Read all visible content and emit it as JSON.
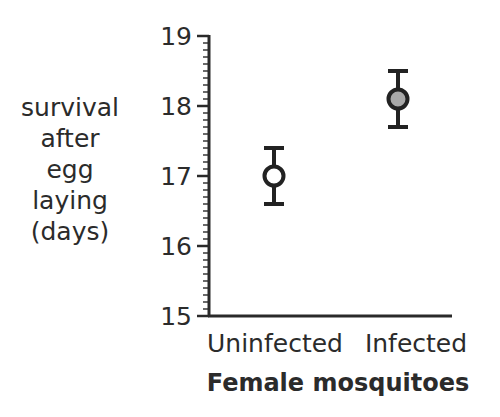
{
  "chart_data": {
    "type": "scatter",
    "subtype": "point_with_error_bars",
    "title": "",
    "xlabel": "Female mosquitoes",
    "ylabel": "survival after egg laying (days)",
    "ylabel_lines": [
      "survival",
      "after",
      "egg",
      "laying",
      "(days)"
    ],
    "categories": [
      "Uninfected",
      "Infected"
    ],
    "values": [
      17.0,
      18.1
    ],
    "error_low": [
      16.6,
      17.7
    ],
    "error_high": [
      17.4,
      18.5
    ],
    "marker_fill": [
      "#ffffff",
      "#a8a8a8"
    ],
    "marker_stroke": "#222222",
    "ylim": [
      15,
      19
    ],
    "yticks": [
      15,
      16,
      17,
      18,
      19
    ],
    "yminor_tick_step": 0.1,
    "grid": false,
    "legend": null
  }
}
